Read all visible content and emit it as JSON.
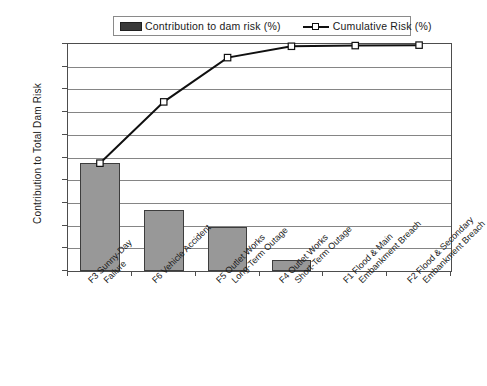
{
  "chart_data": {
    "type": "bar",
    "title": "",
    "subtitle": "",
    "xlabel": "",
    "ylabel": "Contribution to Total Dam Risk",
    "ylim": [
      0,
      100
    ],
    "ytick_labels": [
      "100%",
      "90%",
      "80%",
      "70%",
      "60%",
      "50%",
      "40%",
      "30%",
      "20%",
      "10%",
      "0%"
    ],
    "ytick_values": [
      100,
      90,
      80,
      70,
      60,
      50,
      40,
      30,
      20,
      10,
      0
    ],
    "grid": true,
    "legend_position": "top",
    "categories": [
      "F3 Sunny-Day Failure",
      "F6 Vehicle Accident",
      "F5 Outlet Works Long-Term Outage",
      "F4 Outlet Works Short-Term Outage",
      "F1 Flood & Main Embankment Breach",
      "F2 Flood & Secondary Embankment Breach"
    ],
    "category_lines": [
      [
        "F3 Sunny-Day",
        "Failure"
      ],
      [
        "F6 Vehicle Accident",
        ""
      ],
      [
        "F5 Outlet Works",
        "Long-Term Outage"
      ],
      [
        "F4 Outlet Works",
        "Short-Term Outage"
      ],
      [
        "F1 Flood & Main",
        "Embankment Breach"
      ],
      [
        "F2 Flood & Secondary",
        "Embankment Breach"
      ]
    ],
    "series": [
      {
        "name": "Contribution to dam risk (%)",
        "type": "bar",
        "values": [
          47.5,
          27.0,
          19.5,
          5.0,
          0.3,
          0.2
        ],
        "color": "#989898"
      },
      {
        "name": "Cumulative  Risk  (%)",
        "type": "line",
        "values": [
          47.5,
          74.5,
          94.0,
          99.0,
          99.3,
          99.5
        ],
        "color": "#101010"
      }
    ]
  },
  "legend": {
    "bar_label": "Contribution to dam risk (%)",
    "line_label": "Cumulative  Risk  (%)",
    "bar_swatch_color": "#3a3a3a",
    "line_color": "#101010",
    "marker_fill": "#ffffff"
  },
  "axes": {
    "y_title": "Contribution to Total Dam Risk"
  }
}
